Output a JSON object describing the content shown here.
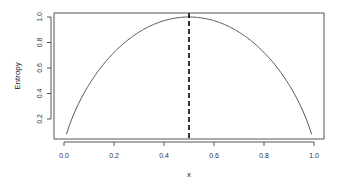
{
  "chart_data": {
    "type": "line",
    "title": "",
    "xlabel": "x",
    "ylabel": "Entropy",
    "xlim": [
      0,
      1
    ],
    "ylim": [
      0.08,
      1.0
    ],
    "grid": false,
    "legend": null,
    "x_ticks": [
      "0.0",
      "0.2",
      "0.4",
      "0.6",
      "0.8",
      "1.0"
    ],
    "y_ticks": [
      "0.2",
      "0.4",
      "0.6",
      "0.8",
      "1.0"
    ],
    "series": [
      {
        "name": "binary entropy H(x) = -x log2 x - (1-x) log2 (1-x)",
        "x": [
          0.01,
          0.05,
          0.1,
          0.15,
          0.2,
          0.25,
          0.3,
          0.35,
          0.4,
          0.45,
          0.5,
          0.55,
          0.6,
          0.65,
          0.7,
          0.75,
          0.8,
          0.85,
          0.9,
          0.95,
          0.99
        ],
        "values": [
          0.081,
          0.286,
          0.469,
          0.61,
          0.722,
          0.811,
          0.881,
          0.934,
          0.971,
          0.993,
          1.0,
          0.993,
          0.971,
          0.934,
          0.881,
          0.811,
          0.722,
          0.61,
          0.469,
          0.286,
          0.081
        ]
      }
    ],
    "annotations": [
      {
        "type": "vline",
        "x": 0.5,
        "style": "dashed"
      }
    ]
  }
}
